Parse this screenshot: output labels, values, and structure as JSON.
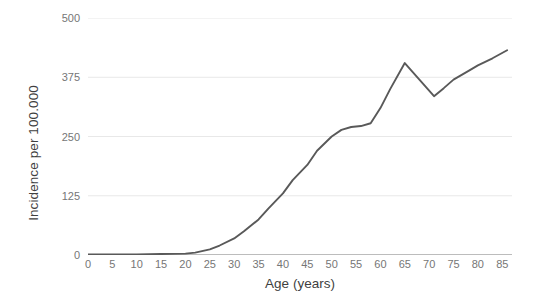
{
  "chart_data": {
    "type": "line",
    "title": "",
    "subtitle": "",
    "xlabel": "Age (years)",
    "ylabel": "Incidence per 100.000",
    "xlim": [
      0,
      87
    ],
    "ylim": [
      0,
      500
    ],
    "xticks": [
      0,
      5,
      10,
      15,
      20,
      25,
      30,
      35,
      40,
      45,
      50,
      55,
      60,
      65,
      70,
      75,
      80,
      85
    ],
    "yticks": [
      0,
      125,
      250,
      375,
      500
    ],
    "xtick_labels": [
      "0",
      "5",
      "10",
      "15",
      "20",
      "25",
      "30",
      "35",
      "40",
      "45",
      "50",
      "55",
      "60",
      "65",
      "70",
      "75",
      "80",
      "85"
    ],
    "ytick_labels": [
      "0",
      "125",
      "250",
      "375",
      "500"
    ],
    "grid": "horizontal",
    "legend": "none",
    "series": [
      {
        "name": "Incidence",
        "color": "#595959",
        "x": [
          0,
          5,
          10,
          15,
          20,
          22,
          25,
          27,
          30,
          32,
          35,
          37,
          40,
          42,
          45,
          47,
          50,
          52,
          54,
          56,
          58,
          60,
          62,
          65,
          68,
          71,
          73,
          75,
          78,
          80,
          83,
          86
        ],
        "values": [
          1,
          1,
          1,
          2,
          3,
          5,
          12,
          20,
          35,
          50,
          75,
          98,
          130,
          158,
          190,
          220,
          250,
          264,
          270,
          272,
          278,
          310,
          350,
          405,
          370,
          335,
          352,
          370,
          388,
          400,
          415,
          432
        ]
      }
    ],
    "colors": {
      "line": "#595959",
      "grid": "#e8e8e8",
      "axis": "#a6a6a6",
      "tick_text": "#767676",
      "title_text": "#3f3f3f",
      "background": "#ffffff"
    }
  }
}
